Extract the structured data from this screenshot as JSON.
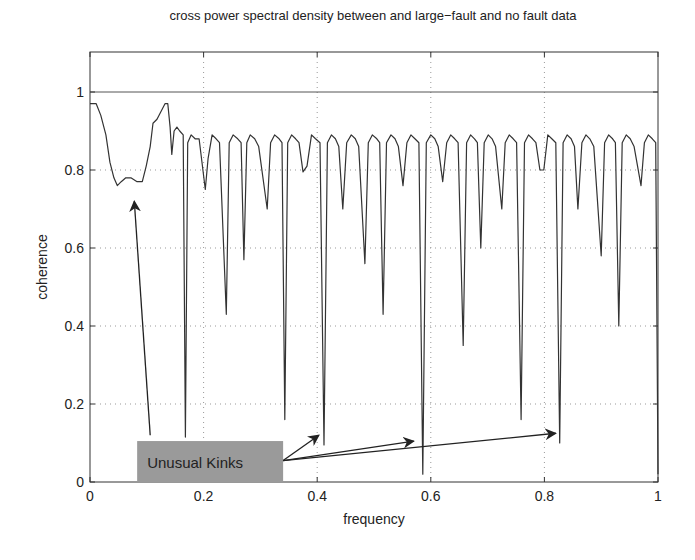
{
  "chart_data": {
    "type": "line",
    "title": "cross power spectral density between and large−fault and no fault data",
    "xlabel": "frequency",
    "ylabel": "coherence",
    "xlim": [
      0,
      1
    ],
    "ylim": [
      0,
      1.1
    ],
    "grid": true,
    "xticks": [
      "0",
      "0.2",
      "0.4",
      "0.6",
      "0.8",
      "1"
    ],
    "yticks": [
      "0",
      "0.2",
      "0.4",
      "0.6",
      "0.8",
      "1"
    ],
    "reference_line": {
      "y": 1,
      "label": "coherence = 1"
    },
    "series": [
      {
        "name": "coherence",
        "color": "#333333",
        "x": [
          0.0,
          0.011,
          0.019,
          0.028,
          0.035,
          0.042,
          0.048,
          0.055,
          0.063,
          0.072,
          0.083,
          0.092,
          0.099,
          0.106,
          0.111,
          0.118,
          0.125,
          0.132,
          0.137,
          0.141,
          0.144,
          0.148,
          0.153,
          0.158,
          0.164,
          0.168,
          0.172,
          0.178,
          0.185,
          0.192,
          0.203,
          0.208,
          0.215,
          0.222,
          0.228,
          0.24,
          0.245,
          0.252,
          0.26,
          0.266,
          0.271,
          0.276,
          0.282,
          0.29,
          0.297,
          0.312,
          0.318,
          0.325,
          0.333,
          0.338,
          0.343,
          0.348,
          0.355,
          0.362,
          0.368,
          0.375,
          0.382,
          0.39,
          0.397,
          0.405,
          0.412,
          0.418,
          0.425,
          0.432,
          0.438,
          0.445,
          0.452,
          0.46,
          0.467,
          0.473,
          0.484,
          0.49,
          0.497,
          0.505,
          0.51,
          0.516,
          0.522,
          0.53,
          0.537,
          0.543,
          0.551,
          0.558,
          0.565,
          0.572,
          0.579,
          0.586,
          0.592,
          0.6,
          0.607,
          0.613,
          0.621,
          0.628,
          0.635,
          0.642,
          0.648,
          0.657,
          0.663,
          0.67,
          0.677,
          0.682,
          0.688,
          0.694,
          0.701,
          0.708,
          0.714,
          0.725,
          0.731,
          0.738,
          0.745,
          0.751,
          0.759,
          0.765,
          0.772,
          0.779,
          0.785,
          0.792,
          0.799,
          0.806,
          0.813,
          0.82,
          0.827,
          0.833,
          0.84,
          0.847,
          0.853,
          0.859,
          0.866,
          0.873,
          0.88,
          0.887,
          0.9,
          0.906,
          0.913,
          0.92,
          0.925,
          0.931,
          0.937,
          0.944,
          0.951,
          0.958,
          0.97,
          0.976,
          0.983,
          0.99,
          0.996,
          1.0
        ],
        "y": [
          0.97,
          0.97,
          0.94,
          0.89,
          0.82,
          0.78,
          0.76,
          0.77,
          0.78,
          0.78,
          0.77,
          0.77,
          0.81,
          0.86,
          0.92,
          0.93,
          0.95,
          0.97,
          0.97,
          0.91,
          0.84,
          0.9,
          0.91,
          0.9,
          0.89,
          0.115,
          0.87,
          0.89,
          0.88,
          0.88,
          0.75,
          0.83,
          0.89,
          0.88,
          0.87,
          0.43,
          0.87,
          0.89,
          0.88,
          0.87,
          0.57,
          0.87,
          0.89,
          0.88,
          0.86,
          0.7,
          0.87,
          0.89,
          0.88,
          0.87,
          0.16,
          0.87,
          0.89,
          0.88,
          0.87,
          0.795,
          0.81,
          0.89,
          0.88,
          0.87,
          0.095,
          0.87,
          0.89,
          0.88,
          0.86,
          0.7,
          0.87,
          0.89,
          0.88,
          0.86,
          0.56,
          0.87,
          0.89,
          0.88,
          0.87,
          0.43,
          0.87,
          0.89,
          0.88,
          0.86,
          0.76,
          0.87,
          0.89,
          0.88,
          0.87,
          0.02,
          0.87,
          0.89,
          0.88,
          0.86,
          0.77,
          0.87,
          0.89,
          0.88,
          0.87,
          0.35,
          0.87,
          0.89,
          0.88,
          0.87,
          0.6,
          0.87,
          0.89,
          0.88,
          0.86,
          0.7,
          0.87,
          0.89,
          0.88,
          0.87,
          0.16,
          0.87,
          0.89,
          0.88,
          0.87,
          0.8,
          0.8,
          0.89,
          0.88,
          0.87,
          0.1,
          0.87,
          0.89,
          0.88,
          0.86,
          0.7,
          0.87,
          0.89,
          0.88,
          0.86,
          0.58,
          0.87,
          0.89,
          0.88,
          0.87,
          0.4,
          0.87,
          0.89,
          0.88,
          0.86,
          0.76,
          0.87,
          0.89,
          0.88,
          0.87,
          0.02
        ]
      }
    ],
    "annotations": [
      {
        "text": "Unusual Kinks",
        "box": {
          "x0": 0.083,
          "x1": 0.34,
          "y0": 0.0,
          "y1": 0.105,
          "fill": "#9a9a9a"
        },
        "arrows": [
          {
            "from": [
              0.106,
              0.12
            ],
            "to": [
              0.078,
              0.72
            ]
          },
          {
            "from": [
              0.34,
              0.055
            ],
            "to": [
              0.403,
              0.12
            ]
          },
          {
            "from": [
              0.34,
              0.055
            ],
            "to": [
              0.57,
              0.105
            ]
          },
          {
            "from": [
              0.34,
              0.055
            ],
            "to": [
              0.82,
              0.125
            ]
          }
        ]
      }
    ]
  }
}
